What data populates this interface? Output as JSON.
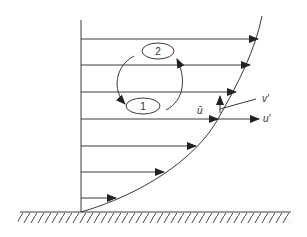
{
  "diagram": {
    "colors": {
      "line": "#3a3a3a",
      "background": "#ffffff"
    },
    "eddies": [
      {
        "id": "eddy-2",
        "label": "2"
      },
      {
        "id": "eddy-1",
        "label": "1"
      }
    ],
    "labels": {
      "mean_velocity": "ū",
      "v_fluctuation": "v′",
      "u_fluctuation": "u′"
    },
    "velocity_arrows": [
      {
        "y": 39,
        "x_end": 258
      },
      {
        "y": 65,
        "x_end": 250
      },
      {
        "y": 92,
        "x_end": 236
      },
      {
        "y": 119,
        "x_end": 218
      },
      {
        "y": 146,
        "x_end": 196
      },
      {
        "y": 172,
        "x_end": 164
      },
      {
        "y": 198,
        "x_end": 116
      }
    ],
    "wall": {
      "label": "solid wall (hatched)"
    }
  }
}
